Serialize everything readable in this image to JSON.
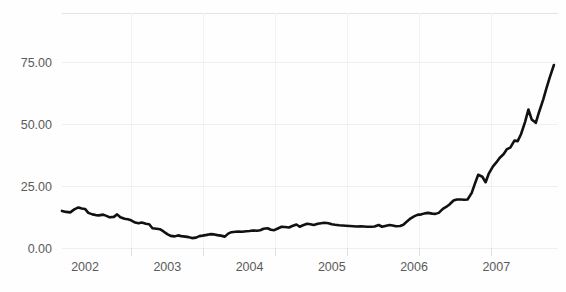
{
  "chart_data": {
    "type": "line",
    "title": "",
    "subtitle": "",
    "xlabel": "",
    "ylabel": "",
    "xlim": [
      2001.72,
      2007.75
    ],
    "ylim": [
      -2.0,
      80.0
    ],
    "grid": true,
    "legend": false,
    "legend_position": "none",
    "series_color": "#111111",
    "background_color": "#fefefe",
    "gridline_color": "#efefef",
    "tick_label_color": "#5a5a5a",
    "y_ticks": [
      0,
      25,
      50,
      75
    ],
    "y_tick_labels": [
      "0.00",
      "25.00",
      "50.00",
      "75.00"
    ],
    "x_ticks": [
      2002,
      2003,
      2004,
      2005,
      2006,
      2007
    ],
    "x_tick_labels": [
      "2002",
      "2003",
      "2004",
      "2005",
      "2006",
      "2007"
    ],
    "series": [
      {
        "name": "",
        "x": [
          2001.72,
          2001.77,
          2001.82,
          2001.87,
          2001.92,
          2001.96,
          2002.0,
          2002.04,
          2002.09,
          2002.13,
          2002.17,
          2002.22,
          2002.26,
          2002.3,
          2002.35,
          2002.39,
          2002.43,
          2002.48,
          2002.52,
          2002.56,
          2002.61,
          2002.65,
          2002.69,
          2002.74,
          2002.78,
          2002.82,
          2002.87,
          2002.91,
          2002.95,
          2003.0,
          2003.04,
          2003.09,
          2003.13,
          2003.17,
          2003.22,
          2003.26,
          2003.3,
          2003.35,
          2003.39,
          2003.43,
          2003.48,
          2003.52,
          2003.57,
          2003.61,
          2003.65,
          2003.7,
          2003.74,
          2003.78,
          2003.83,
          2003.87,
          2003.91,
          2003.96,
          2004.0,
          2004.04,
          2004.09,
          2004.13,
          2004.17,
          2004.22,
          2004.26,
          2004.3,
          2004.35,
          2004.39,
          2004.43,
          2004.48,
          2004.52,
          2004.57,
          2004.61,
          2004.65,
          2004.7,
          2004.74,
          2004.78,
          2004.83,
          2004.87,
          2004.91,
          2004.96,
          2005.0,
          2005.04,
          2005.09,
          2005.13,
          2005.17,
          2005.22,
          2005.26,
          2005.3,
          2005.35,
          2005.39,
          2005.43,
          2005.48,
          2005.52,
          2005.57,
          2005.61,
          2005.65,
          2005.7,
          2005.74,
          2005.78,
          2005.83,
          2005.87,
          2005.91,
          2005.96,
          2006.0,
          2006.04,
          2006.09,
          2006.13,
          2006.17,
          2006.22,
          2006.26,
          2006.3,
          2006.35,
          2006.39,
          2006.43,
          2006.48,
          2006.52,
          2006.57,
          2006.61,
          2006.65,
          2006.7,
          2006.74,
          2006.78,
          2006.83,
          2006.87,
          2006.91,
          2006.96,
          2007.0,
          2007.04,
          2007.09,
          2007.13,
          2007.17,
          2007.22,
          2007.26,
          2007.3,
          2007.35,
          2007.39,
          2007.43,
          2007.48,
          2007.52,
          2007.57,
          2007.61,
          2007.65,
          2007.7
        ],
        "values": [
          15.0,
          14.6,
          14.4,
          15.6,
          16.4,
          16.0,
          15.8,
          14.2,
          13.6,
          13.3,
          13.2,
          13.5,
          13.0,
          12.4,
          12.6,
          13.6,
          12.4,
          11.8,
          11.6,
          11.2,
          10.3,
          10.0,
          10.3,
          9.8,
          9.6,
          8.0,
          7.8,
          7.6,
          6.8,
          5.6,
          4.9,
          4.7,
          5.1,
          4.8,
          4.6,
          4.4,
          4.0,
          4.2,
          4.8,
          5.0,
          5.3,
          5.6,
          5.5,
          5.2,
          5.0,
          4.6,
          5.8,
          6.4,
          6.6,
          6.7,
          6.6,
          6.8,
          6.9,
          7.1,
          7.0,
          7.2,
          7.8,
          8.0,
          7.4,
          7.2,
          8.0,
          8.6,
          8.5,
          8.3,
          8.9,
          9.5,
          8.6,
          9.2,
          9.8,
          9.6,
          9.3,
          9.8,
          10.0,
          10.2,
          10.0,
          9.6,
          9.4,
          9.2,
          9.1,
          9.0,
          8.9,
          8.8,
          8.7,
          8.8,
          8.7,
          8.6,
          8.6,
          8.7,
          9.3,
          8.6,
          8.9,
          9.3,
          9.1,
          8.8,
          8.9,
          9.4,
          10.6,
          12.0,
          12.8,
          13.4,
          13.6,
          14.0,
          14.2,
          13.9,
          13.8,
          14.2,
          15.8,
          16.6,
          17.6,
          19.2,
          19.6,
          19.6,
          19.5,
          19.6,
          22.2,
          26.0,
          29.6,
          28.8,
          26.6,
          30.2,
          33.0,
          34.6,
          36.4,
          38.0,
          40.0,
          40.6,
          43.4,
          43.2,
          46.0,
          51.0,
          56.0,
          52.0,
          50.6,
          55.0,
          60.0,
          64.6,
          69.0,
          74.0
        ]
      }
    ]
  }
}
